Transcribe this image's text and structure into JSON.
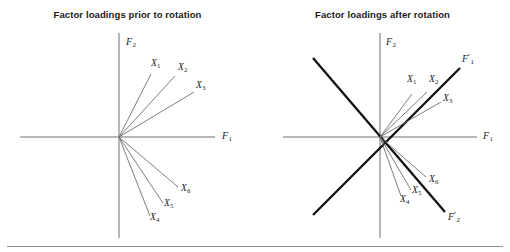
{
  "figure": {
    "background_color": "#ffffff",
    "rule_color": "#8c8c8c",
    "vector_color": "#6e6e6e",
    "axis_color": "#6e6e6e",
    "rotated_axis_color": "#111111",
    "text_color": "#1a1a1a"
  },
  "panels": [
    {
      "id": "prior",
      "title": "Factor loadings prior to rotation",
      "origin": {
        "x": 119,
        "y": 137
      },
      "axes": [
        {
          "name": "F1",
          "label_base": "F",
          "label_sub": "1",
          "label_prime": "",
          "label_x": 222,
          "label_y": 130,
          "x1": 20,
          "y1": 137,
          "x2": 215,
          "y2": 137,
          "weight": 1
        },
        {
          "name": "F2",
          "label_base": "F",
          "label_sub": "2",
          "label_prime": "",
          "label_x": 126,
          "label_y": 36,
          "x1": 119,
          "y1": 33,
          "x2": 119,
          "y2": 238,
          "weight": 1
        }
      ],
      "vectors": [
        {
          "name": "X1",
          "label_base": "X",
          "label_sub": "1",
          "x2": 151,
          "y2": 74,
          "label_x": 151,
          "label_y": 58
        },
        {
          "name": "X2",
          "label_base": "X",
          "label_sub": "2",
          "x2": 175,
          "y2": 76,
          "label_x": 178,
          "label_y": 62
        },
        {
          "name": "X3",
          "label_base": "X",
          "label_sub": "3",
          "x2": 194,
          "y2": 92,
          "label_x": 196,
          "label_y": 80
        },
        {
          "name": "X6",
          "label_base": "X",
          "label_sub": "6",
          "x2": 178,
          "y2": 187,
          "label_x": 181,
          "label_y": 183
        },
        {
          "name": "X5",
          "label_base": "X",
          "label_sub": "5",
          "x2": 163,
          "y2": 203,
          "label_x": 164,
          "label_y": 198
        },
        {
          "name": "X4",
          "label_base": "X",
          "label_sub": "4",
          "x2": 150,
          "y2": 216,
          "label_x": 150,
          "label_y": 212
        }
      ]
    },
    {
      "id": "after",
      "title": "Factor loadings after rotation",
      "origin": {
        "x": 125,
        "y": 137
      },
      "axes": [
        {
          "name": "F1",
          "label_base": "F",
          "label_sub": "1",
          "label_prime": "",
          "label_x": 228,
          "label_y": 130,
          "x1": 28,
          "y1": 137,
          "x2": 222,
          "y2": 137,
          "weight": 1
        },
        {
          "name": "F2",
          "label_base": "F",
          "label_sub": "2",
          "label_prime": "",
          "label_x": 131,
          "label_y": 36,
          "x1": 125,
          "y1": 33,
          "x2": 125,
          "y2": 238,
          "weight": 1
        }
      ],
      "rotated_axes": [
        {
          "name": "F1-prime",
          "label_base": "F",
          "label_sub": "1",
          "label_prime": "′",
          "label_x": 207,
          "label_y": 52,
          "x1": 58,
          "y1": 215,
          "x2": 205,
          "y2": 68,
          "weight": 2.3
        },
        {
          "name": "F2-prime",
          "label_base": "F",
          "label_sub": "2",
          "label_prime": "′",
          "label_x": 193,
          "label_y": 210,
          "x1": 58,
          "y1": 58,
          "x2": 190,
          "y2": 212,
          "weight": 2.3
        }
      ],
      "vectors": [
        {
          "name": "X1",
          "label_base": "X",
          "label_sub": "1",
          "x2": 157,
          "y2": 94,
          "label_x": 152,
          "label_y": 74
        },
        {
          "name": "X2",
          "label_base": "X",
          "label_sub": "2",
          "x2": 172,
          "y2": 92,
          "label_x": 174,
          "label_y": 74
        },
        {
          "name": "X3",
          "label_base": "X",
          "label_sub": "3",
          "x2": 186,
          "y2": 102,
          "label_x": 188,
          "label_y": 93
        },
        {
          "name": "X6",
          "label_base": "X",
          "label_sub": "6",
          "x2": 171,
          "y2": 177,
          "label_x": 174,
          "label_y": 174
        },
        {
          "name": "X5",
          "label_base": "X",
          "label_sub": "5",
          "x2": 156,
          "y2": 190,
          "label_x": 157,
          "label_y": 185
        },
        {
          "name": "X4",
          "label_base": "X",
          "label_sub": "4",
          "x2": 146,
          "y2": 196,
          "label_x": 145,
          "label_y": 194
        }
      ]
    }
  ]
}
